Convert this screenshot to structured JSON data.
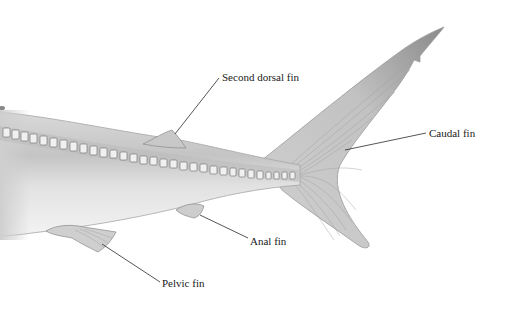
{
  "diagram": {
    "labels": [
      {
        "id": "second-dorsal-fin",
        "text": "Second dorsal fin",
        "x": 222,
        "y": 72
      },
      {
        "id": "caudal-fin",
        "text": "Caudal fin",
        "x": 429,
        "y": 127
      },
      {
        "id": "anal-fin",
        "text": "Anal fin",
        "x": 250,
        "y": 237
      },
      {
        "id": "pelvic-fin",
        "text": "Pelvic fin",
        "x": 162,
        "y": 278
      }
    ]
  }
}
